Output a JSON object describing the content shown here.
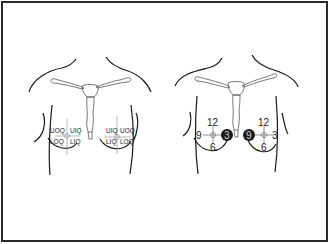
{
  "figure": {
    "panels": [
      {
        "name": "quadrant-panel",
        "description": "Chest diagram with breast quadrants",
        "right_breast_labels": {
          "upper_outer": "UOQ",
          "upper_inner": "UIQ",
          "lower_outer": "LOQ",
          "lower_inner": "LIQ"
        },
        "left_breast_labels": {
          "upper_inner": "UIQ",
          "upper_outer": "UOQ",
          "lower_inner": "LIQ",
          "lower_outer": "LOQ"
        }
      },
      {
        "name": "clock-panel",
        "description": "Chest diagram with clock-face positions",
        "right_breast_labels": {
          "top": "12",
          "left": "9",
          "right": "3",
          "bottom": "6",
          "highlighted": "3"
        },
        "left_breast_labels": {
          "top": "12",
          "left": "9",
          "right": "3",
          "bottom": "6",
          "highlighted": "9"
        }
      }
    ],
    "colors": {
      "line": "#1a1a1a",
      "bone": "#555555",
      "frame": "#2a2a2a",
      "highlight": "#1a1a1a"
    }
  }
}
